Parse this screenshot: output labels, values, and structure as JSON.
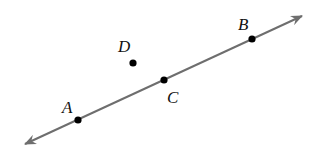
{
  "diagram": {
    "line": {
      "start": [
        25,
        144
      ],
      "end": [
        302,
        16
      ],
      "color": "#6e6e6e",
      "arrows": "both"
    },
    "points": [
      {
        "name": "A",
        "label": "A",
        "x": 78,
        "y": 120,
        "label_x": 62,
        "label_y": 113
      },
      {
        "name": "C",
        "label": "C",
        "x": 164,
        "y": 80,
        "label_x": 167,
        "label_y": 103
      },
      {
        "name": "B",
        "label": "B",
        "x": 252,
        "y": 39,
        "label_x": 238,
        "label_y": 30
      },
      {
        "name": "D",
        "label": "D",
        "x": 133,
        "y": 63,
        "label_x": 118,
        "label_y": 52
      }
    ],
    "point_color": "#000000"
  }
}
